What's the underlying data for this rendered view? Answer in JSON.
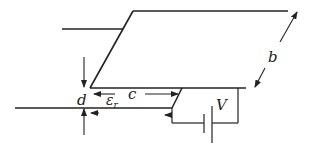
{
  "diagram": {
    "labels": {
      "b": "b",
      "c": "c",
      "d": "d",
      "epsilon": "ε",
      "epsilon_sub": "r",
      "V": "V"
    },
    "colors": {
      "stroke": "#222222",
      "background": "#ffffff"
    }
  }
}
